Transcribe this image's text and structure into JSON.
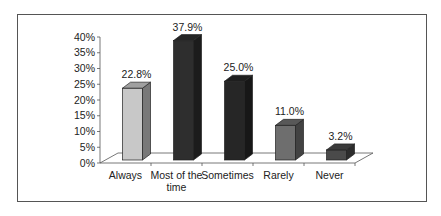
{
  "chart_data": {
    "type": "bar",
    "style": "3d-column",
    "title": "",
    "xlabel": "",
    "ylabel": "",
    "categories": [
      "Always",
      "Most of the time",
      "Sometimes",
      "Rarely",
      "Never"
    ],
    "category_label_lines": [
      [
        "Always"
      ],
      [
        "Most of the",
        "time"
      ],
      [
        "Sometimes"
      ],
      [
        "Rarely"
      ],
      [
        "Never"
      ]
    ],
    "values": [
      22.8,
      37.9,
      25.0,
      11.0,
      3.2
    ],
    "data_labels": [
      "22.8%",
      "37.9%",
      "25.0%",
      "11.0%",
      "3.2%"
    ],
    "bar_colors": [
      "#c8c8c8",
      "#2e2e2e",
      "#262626",
      "#6e6e6e",
      "#4a4a4a"
    ],
    "ylim": [
      0,
      40
    ],
    "yticks": [
      0,
      5,
      10,
      15,
      20,
      25,
      30,
      35,
      40
    ],
    "ytick_labels": [
      "0%",
      "5%",
      "10%",
      "15%",
      "20%",
      "25%",
      "30%",
      "35%",
      "40%"
    ],
    "grid": false,
    "legend": "none"
  }
}
